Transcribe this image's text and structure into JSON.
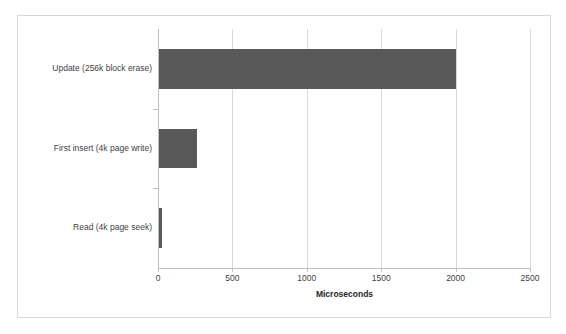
{
  "chart_data": {
    "type": "bar",
    "orientation": "horizontal",
    "title": "",
    "subtitle": "",
    "categories": [
      "Update (256k block erase)",
      "First insert (4k page write)",
      "Read (4k page seek)"
    ],
    "values": [
      2000,
      260,
      27
    ],
    "series": [
      {
        "name": "Microseconds",
        "values": [
          2000,
          260,
          27
        ]
      }
    ],
    "xlabel": "Microseconds",
    "ylabel": "",
    "xlim": [
      0,
      2500
    ],
    "xticks": [
      0,
      500,
      1000,
      1500,
      2000,
      2500
    ],
    "xtick_labels": [
      "0",
      "500",
      "1000",
      "1500",
      "2000",
      "2500"
    ],
    "grid": "vertical",
    "legend": "none",
    "bar_color": "#595959",
    "gridline_color": "#d9d9d9",
    "axis_color": "#bfbfbf",
    "border_color": "#d9d9d9",
    "text_color": "#3f3f3f",
    "background": "#ffffff"
  }
}
